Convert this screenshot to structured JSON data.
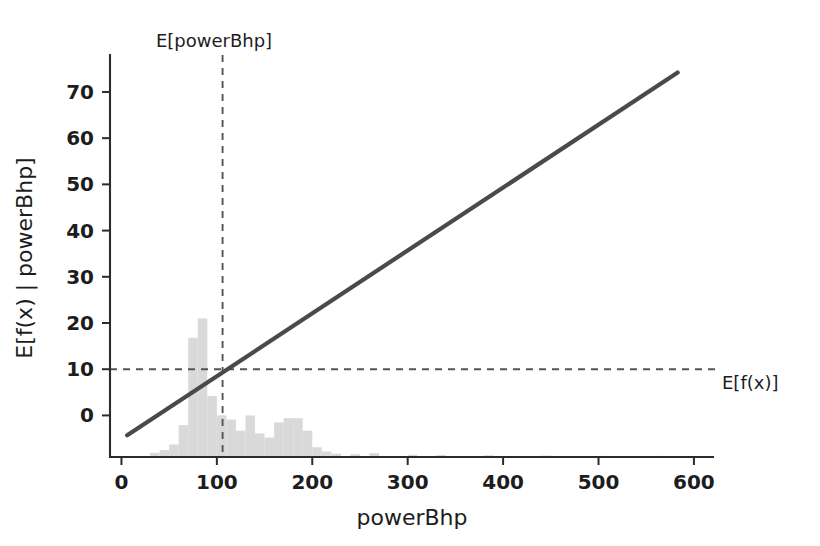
{
  "chart_data": {
    "type": "line",
    "title": "",
    "xlabel": "powerBhp",
    "ylabel": "E[f(x) | powerBhp]",
    "xlim": [
      -12,
      620
    ],
    "ylim": [
      -9,
      78
    ],
    "xticks": [
      0,
      100,
      200,
      300,
      400,
      500,
      600
    ],
    "xticklabels": [
      "0",
      "100",
      "200",
      "300",
      "400",
      "500",
      "600"
    ],
    "yticks": [
      0,
      10,
      20,
      30,
      40,
      50,
      60,
      70
    ],
    "yticklabels": [
      "0",
      "10",
      "20",
      "30",
      "40",
      "50",
      "60",
      "70"
    ],
    "grid": false,
    "legend": "none",
    "series": [
      {
        "name": "E[f(x) | powerBhp]",
        "type": "line",
        "color": "#4a4a4a",
        "x": [
          6,
          583
        ],
        "y": [
          -4.3,
          74.2
        ]
      }
    ],
    "annotations": [
      {
        "name": "E[powerBhp]",
        "label": "E[powerBhp]",
        "type": "vline",
        "value": 106,
        "style": "dashed",
        "label_position": "top"
      },
      {
        "name": "E[f(x)]",
        "label": "E[f(x)]",
        "type": "hline",
        "value": 10,
        "style": "dashed",
        "label_position": "right"
      }
    ],
    "histogram": {
      "name": "powerBhp distribution",
      "color": "#d9d9d9",
      "baseline": -9,
      "bin_width": 10,
      "bins": [
        {
          "x": 30,
          "h": 0.15
        },
        {
          "x": 40,
          "h": 0.25
        },
        {
          "x": 50,
          "h": 0.45
        },
        {
          "x": 60,
          "h": 1.15
        },
        {
          "x": 70,
          "h": 4.3
        },
        {
          "x": 80,
          "h": 5.0
        },
        {
          "x": 90,
          "h": 2.2
        },
        {
          "x": 100,
          "h": 1.5
        },
        {
          "x": 110,
          "h": 1.35
        },
        {
          "x": 120,
          "h": 0.95
        },
        {
          "x": 130,
          "h": 1.5
        },
        {
          "x": 140,
          "h": 0.85
        },
        {
          "x": 150,
          "h": 0.7
        },
        {
          "x": 160,
          "h": 1.25
        },
        {
          "x": 170,
          "h": 1.4
        },
        {
          "x": 180,
          "h": 1.4
        },
        {
          "x": 190,
          "h": 0.95
        },
        {
          "x": 200,
          "h": 0.35
        },
        {
          "x": 210,
          "h": 0.2
        },
        {
          "x": 220,
          "h": 0.12
        },
        {
          "x": 240,
          "h": 0.1
        },
        {
          "x": 260,
          "h": 0.14
        },
        {
          "x": 300,
          "h": 0.08
        },
        {
          "x": 330,
          "h": 0.07
        },
        {
          "x": 380,
          "h": 0.06
        },
        {
          "x": 440,
          "h": 0.05
        },
        {
          "x": 500,
          "h": 0.04
        },
        {
          "x": 560,
          "h": 0.04
        }
      ]
    },
    "colors": {
      "line": "#4a4a4a",
      "histogram": "#d9d9d9",
      "guide": "#555555",
      "text": "#1d1d1d",
      "background": "#ffffff"
    }
  }
}
